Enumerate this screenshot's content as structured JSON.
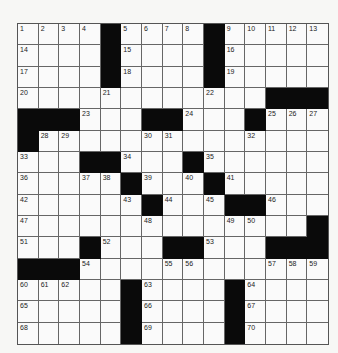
{
  "puzzle": {
    "rows": 15,
    "cols": 15,
    "colors": {
      "black": "#0a0a0a",
      "white": "#fafafa",
      "line": "#666666"
    },
    "grid": [
      [
        "1",
        "2",
        "3",
        "4",
        "#",
        "5",
        "6",
        "7",
        "8",
        "#",
        "9",
        "10",
        "11",
        "12",
        "13"
      ],
      [
        "14",
        "",
        "",
        "",
        "#",
        "15",
        "",
        "",
        "",
        "#",
        "16",
        "",
        "",
        "",
        ""
      ],
      [
        "17",
        "",
        "",
        "",
        "#",
        "18",
        "",
        "",
        "",
        "#",
        "19",
        "",
        "",
        "",
        ""
      ],
      [
        "20",
        "",
        "",
        "",
        "21",
        "",
        "",
        "",
        "",
        "22",
        "",
        "",
        "#",
        "#",
        "#"
      ],
      [
        "#",
        "#",
        "#",
        "23",
        "",
        "",
        "#",
        "#",
        "24",
        "",
        "",
        "#",
        "25",
        "26",
        "27"
      ],
      [
        "#",
        "28",
        "29",
        "",
        "",
        "",
        "30",
        "31",
        "",
        "",
        "",
        "32",
        "",
        "",
        ""
      ],
      [
        "33",
        "",
        "",
        "#",
        "#",
        "34",
        "",
        "",
        "#",
        "35",
        "",
        "",
        "",
        "",
        ""
      ],
      [
        "36",
        "",
        "",
        "37",
        "38",
        "#",
        "39",
        "",
        "40",
        "#",
        "41",
        "",
        "",
        "",
        ""
      ],
      [
        "42",
        "",
        "",
        "",
        "",
        "43",
        "#",
        "44",
        "",
        "45",
        "#",
        "#",
        "46",
        "",
        ""
      ],
      [
        "47",
        "",
        "",
        "",
        "",
        "",
        "48",
        "",
        "",
        "",
        "49",
        "50",
        "",
        "",
        "#"
      ],
      [
        "51",
        "",
        "",
        "#",
        "52",
        "",
        "",
        "#",
        "#",
        "53",
        "",
        "",
        "#",
        "#",
        "#"
      ],
      [
        "#",
        "#",
        "#",
        "54",
        "",
        "",
        "",
        "55",
        "56",
        "",
        "",
        "",
        "57",
        "58",
        "59"
      ],
      [
        "60",
        "61",
        "62",
        "",
        "",
        "#",
        "63",
        "",
        "",
        "",
        "#",
        "64",
        "",
        "",
        ""
      ],
      [
        "65",
        "",
        "",
        "",
        "",
        "#",
        "66",
        "",
        "",
        "",
        "#",
        "67",
        "",
        "",
        ""
      ],
      [
        "68",
        "",
        "",
        "",
        "",
        "#",
        "69",
        "",
        "",
        "",
        "#",
        "70",
        "",
        "",
        ""
      ]
    ]
  }
}
